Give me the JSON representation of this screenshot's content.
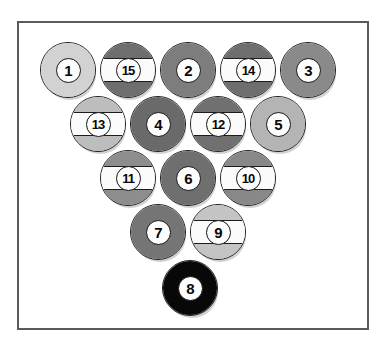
{
  "figure": {
    "frame": {
      "border_color": "#5a5a5a",
      "background_color": "#ffffff",
      "x": 17,
      "y": 21,
      "width": 352,
      "height": 309
    },
    "ball_outline_color": "#1c1c1c",
    "number_disc_color": "#fdfdfd",
    "stripe_band_color": "#fbfbfb"
  },
  "rack": {
    "ball_diameter": 56,
    "rows": [
      {
        "row": 1,
        "count": 5,
        "y": 70
      },
      {
        "row": 2,
        "count": 4,
        "y": 124
      },
      {
        "row": 3,
        "count": 3,
        "y": 178
      },
      {
        "row": 4,
        "count": 2,
        "y": 232
      },
      {
        "row": 5,
        "count": 1,
        "y": 288
      }
    ],
    "balls": [
      {
        "number": "1",
        "type": "solid",
        "color": "#d2d2d2",
        "x": 68,
        "y": 70,
        "row": 1,
        "pos": 1
      },
      {
        "number": "15",
        "type": "stripe",
        "color": "#6e6e6e",
        "x": 128,
        "y": 70,
        "row": 1,
        "pos": 2
      },
      {
        "number": "2",
        "type": "solid",
        "color": "#7d7d7d",
        "x": 188,
        "y": 70,
        "row": 1,
        "pos": 3
      },
      {
        "number": "14",
        "type": "stripe",
        "color": "#6e6e6e",
        "x": 248,
        "y": 70,
        "row": 1,
        "pos": 4
      },
      {
        "number": "3",
        "type": "solid",
        "color": "#8a8a8a",
        "x": 308,
        "y": 70,
        "row": 1,
        "pos": 5
      },
      {
        "number": "13",
        "type": "stripe",
        "color": "#bdbdbd",
        "x": 98,
        "y": 124,
        "row": 2,
        "pos": 1
      },
      {
        "number": "4",
        "type": "solid",
        "color": "#6a6a6a",
        "x": 158,
        "y": 124,
        "row": 2,
        "pos": 2
      },
      {
        "number": "12",
        "type": "stripe",
        "color": "#707070",
        "x": 218,
        "y": 124,
        "row": 2,
        "pos": 3
      },
      {
        "number": "5",
        "type": "solid",
        "color": "#b4b4b4",
        "x": 278,
        "y": 124,
        "row": 2,
        "pos": 4
      },
      {
        "number": "11",
        "type": "stripe",
        "color": "#8d8d8d",
        "x": 128,
        "y": 178,
        "row": 3,
        "pos": 1
      },
      {
        "number": "6",
        "type": "solid",
        "color": "#6f6f6f",
        "x": 188,
        "y": 178,
        "row": 3,
        "pos": 2
      },
      {
        "number": "10",
        "type": "stripe",
        "color": "#888888",
        "x": 248,
        "y": 178,
        "row": 3,
        "pos": 3
      },
      {
        "number": "7",
        "type": "solid",
        "color": "#757575",
        "x": 158,
        "y": 232,
        "row": 4,
        "pos": 1
      },
      {
        "number": "9",
        "type": "stripe",
        "color": "#c4c4c4",
        "x": 218,
        "y": 232,
        "row": 4,
        "pos": 2
      },
      {
        "number": "8",
        "type": "solid",
        "color": "#080808",
        "x": 190,
        "y": 288,
        "row": 5,
        "pos": 1
      }
    ]
  }
}
